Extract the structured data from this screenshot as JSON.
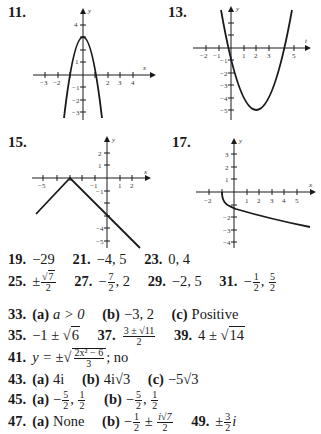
{
  "graphs": [
    {
      "label": "11.",
      "xlabel": "x",
      "ylabel": "y",
      "xticks": [
        "-3",
        "-2",
        "2",
        "3",
        "4"
      ],
      "yticks": [
        "4",
        "1",
        "-1",
        "-2",
        "-3"
      ],
      "curve": "parabola opening down, vertex (0,3)"
    },
    {
      "label": "13.",
      "xlabel": "t",
      "ylabel": "y",
      "xticks": [
        "-2",
        "-1",
        "1",
        "2",
        "3",
        "5"
      ],
      "yticks": [
        "-1",
        "-2",
        "-3",
        "-4",
        "-5"
      ],
      "curve": "parabola opening up, vertex (2,-5)"
    },
    {
      "label": "15.",
      "xlabel": "x",
      "ylabel": "y",
      "xticks": [
        "-5",
        "-1",
        "1",
        "2"
      ],
      "yticks": [
        "2",
        "1",
        "-1",
        "-4",
        "-5"
      ],
      "curve": "inverted V, vertex (-3,0)"
    },
    {
      "label": "17.",
      "xlabel": "x",
      "ylabel": "y",
      "xticks": [
        "-2",
        "1",
        "2",
        "3",
        "4",
        "5"
      ],
      "yticks": [
        "3",
        "2",
        "1",
        "-2",
        "-3",
        "-4"
      ],
      "curve": "decreasing square-root curve from (-1,0)"
    }
  ],
  "answers": {
    "a19": {
      "num": "19.",
      "val": "−29"
    },
    "a21": {
      "num": "21.",
      "val": "−4, 5"
    },
    "a23": {
      "num": "23.",
      "val": "0, 4"
    },
    "a25": {
      "num": "25.",
      "pm": "±",
      "rad": "7",
      "den": "2"
    },
    "a27": {
      "num": "27.",
      "neg": "−",
      "n": "7",
      "d": "2",
      "tail": ", 2"
    },
    "a29": {
      "num": "29.",
      "val": "−2, 5"
    },
    "a31": {
      "num": "31.",
      "neg": "−",
      "n1": "1",
      "d1": "2",
      "n2": "5",
      "d2": "2"
    },
    "a33": {
      "num": "33.",
      "a_lbl": "(a)",
      "a_val": "a > 0",
      "b_lbl": "(b)",
      "b_val": "−3, 2",
      "c_lbl": "(c)",
      "c_val": "Positive"
    },
    "a35": {
      "num": "35.",
      "pre": "−1 ± √",
      "rad": "6"
    },
    "a37": {
      "num": "37.",
      "top": "3 ± √11",
      "den": "2"
    },
    "a39": {
      "num": "39.",
      "pre": "4 ± √",
      "rad": "14"
    },
    "a41": {
      "num": "41.",
      "pre": "y = ±√",
      "top": "2x² − 6",
      "den": "3",
      "tail": "; no"
    },
    "a43": {
      "num": "43.",
      "a_lbl": "(a)",
      "a_val": "4i",
      "b_lbl": "(b)",
      "b_val": "4i√3",
      "c_lbl": "(c)",
      "c_val": "−5√3"
    },
    "a45": {
      "num": "45.",
      "a_lbl": "(a)",
      "b_lbl": "(b)",
      "neg": "−",
      "n1": "5",
      "d1": "2",
      "n2": "1",
      "d2": "2"
    },
    "a47": {
      "num": "47.",
      "a_lbl": "(a)",
      "a_val": "None",
      "b_lbl": "(b)",
      "b_pre": "−",
      "b_n1": "1",
      "b_d1": "2",
      "pm": "±",
      "b_n2": "i√7",
      "b_d2": "2"
    },
    "a49": {
      "num": "49.",
      "pm": "±",
      "n": "3",
      "d": "2",
      "tail": "i"
    }
  }
}
